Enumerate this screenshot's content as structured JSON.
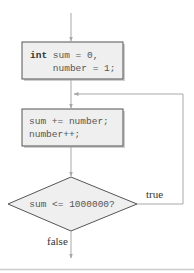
{
  "diagram": {
    "type": "flowchart",
    "nodes": [
      {
        "id": "init",
        "shape": "rectangle",
        "lines": [
          {
            "keyword": "int",
            "rest": " sum = 0,"
          },
          {
            "keyword": "",
            "rest": "    number = 1;"
          }
        ]
      },
      {
        "id": "body",
        "shape": "rectangle",
        "lines": [
          {
            "keyword": "",
            "rest": "sum += number;"
          },
          {
            "keyword": "",
            "rest": "number++;"
          }
        ]
      },
      {
        "id": "cond",
        "shape": "diamond",
        "text": "sum <= 1000000?"
      }
    ],
    "edges": [
      {
        "from": "start",
        "to": "init",
        "label": ""
      },
      {
        "from": "init",
        "to": "body",
        "label": ""
      },
      {
        "from": "body",
        "to": "cond",
        "label": ""
      },
      {
        "from": "cond",
        "to": "body",
        "label": "true"
      },
      {
        "from": "cond",
        "to": "end",
        "label": "false"
      }
    ],
    "labels": {
      "true": "true",
      "false": "false"
    },
    "colors": {
      "line": "#a8a8a8",
      "box_fill": "#efefef",
      "box_stroke": "#555555",
      "shadow": "#cfcfcf"
    }
  }
}
